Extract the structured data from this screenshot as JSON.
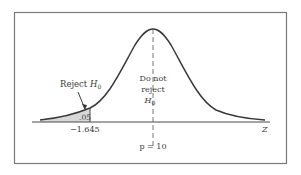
{
  "diagram": {
    "type": "normal-distribution-hypothesis-test",
    "labels": {
      "reject_text": "Reject ",
      "reject_H": "H",
      "reject_sub": "0",
      "alpha": ".05",
      "critical_value": "−1.645",
      "do_not_line1": "Do not",
      "do_not_line2": "reject",
      "do_not_H": "H",
      "do_not_sub": "0",
      "axis_label": "Z",
      "mean_label": "p = 10"
    },
    "colors": {
      "curve": "#3a3a3a",
      "axis": "#4a4a4a",
      "shade": "#d8d8d8",
      "frame": "#7a7a7a"
    }
  }
}
